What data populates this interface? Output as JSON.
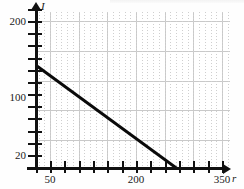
{
  "chart_data": {
    "type": "line",
    "title": "",
    "subtitle": "",
    "xlabel": "r",
    "ylabel": "I",
    "xlim": [
      0,
      350
    ],
    "ylim": [
      0,
      220
    ],
    "grid": true,
    "legend": null,
    "x_ticks": [
      {
        "value": 50,
        "label": "50",
        "px": 50
      },
      {
        "value": 200,
        "label": "200",
        "px": 136
      },
      {
        "value": 350,
        "label": "350",
        "px": 222
      }
    ],
    "y_ticks": [
      {
        "value": 200,
        "label": "200",
        "px": 21
      },
      {
        "value": 100,
        "label": "100",
        "px": 97
      },
      {
        "value": 20,
        "label": "20",
        "px": 155
      }
    ],
    "x_minor_tick_count": 14,
    "y_minor_tick_count": 11,
    "series": [
      {
        "name": "I vs r",
        "points": [
          {
            "r": 10,
            "I": 152
          },
          {
            "r": 280,
            "I": 0
          }
        ],
        "color": "#0a0a0a",
        "line_width_px": 3.2,
        "style": "solid"
      }
    ],
    "annotations": []
  },
  "axes": {
    "y_axis_label": "I",
    "x_axis_label": "r",
    "y_tick_labels": [
      "200",
      "100",
      "20"
    ],
    "x_tick_labels": [
      "50",
      "200",
      "350"
    ]
  },
  "colors": {
    "line": "#0a0a0a",
    "axis": "#111111",
    "grid_major": "#c9c9c9",
    "grid_minor": "#cfcfcf",
    "background": "#ffffff"
  }
}
